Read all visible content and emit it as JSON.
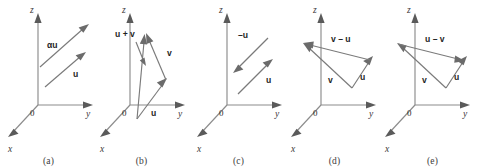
{
  "figure": {
    "background": "#ffffff",
    "axis_color": "#8c8c8c",
    "vector_color": "#7a7a7a",
    "label_color": "#1f1f1f"
  },
  "axes": {
    "z": "z",
    "y": "y",
    "x": "x",
    "origin": "0"
  },
  "panels": [
    {
      "id": "panel-a",
      "caption": "(a)",
      "vectors": [
        {
          "name": "alpha-u",
          "label": "αu"
        },
        {
          "name": "u",
          "label": "u"
        }
      ]
    },
    {
      "id": "panel-b",
      "caption": "(b)",
      "vectors": [
        {
          "name": "u-plus-v",
          "label": "u + v"
        },
        {
          "name": "v",
          "label": "v"
        },
        {
          "name": "u",
          "label": "u"
        }
      ]
    },
    {
      "id": "panel-c",
      "caption": "(c)",
      "vectors": [
        {
          "name": "minus-u",
          "label": "–u"
        },
        {
          "name": "u",
          "label": "u"
        }
      ]
    },
    {
      "id": "panel-d",
      "caption": "(d)",
      "vectors": [
        {
          "name": "v-minus-u",
          "label": "v – u"
        },
        {
          "name": "v",
          "label": "v"
        },
        {
          "name": "u",
          "label": "u"
        }
      ]
    },
    {
      "id": "panel-e",
      "caption": "(e)",
      "vectors": [
        {
          "name": "u-minus-v",
          "label": "u – v"
        },
        {
          "name": "v",
          "label": "v"
        },
        {
          "name": "u",
          "label": "u"
        }
      ]
    }
  ]
}
